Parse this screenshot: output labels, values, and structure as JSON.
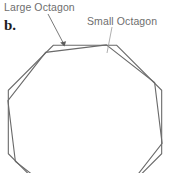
{
  "figure": {
    "part_letter": "b.",
    "labels": {
      "large_octagon": "Large Octagon",
      "small_octagon": "Small Octagon"
    },
    "colors": {
      "outline": "#6a6a6a",
      "label_text": "#6e6e6e",
      "part_letter_text": "#1d1d1d",
      "background": "#ffffff",
      "leader_line": "#7a7a7a"
    }
  },
  "chart_data": {
    "type": "diagram",
    "title": "",
    "shapes": [
      {
        "name": "Large Octagon",
        "sides": 8,
        "center": [
          85,
          122
        ],
        "circumradius": 83,
        "rotation_deg": 22.5,
        "stroke": "#6a6a6a",
        "stroke_width": 1.1,
        "fill": "none"
      },
      {
        "name": "Small Octagon",
        "sides": 8,
        "center": [
          85,
          122
        ],
        "circumradius": 80,
        "rotation_deg": 15.5,
        "stroke": "#6a6a6a",
        "stroke_width": 1.1,
        "fill": "none"
      }
    ],
    "annotations": [
      {
        "text": "Large Octagon",
        "anchor": [
          4,
          1
        ],
        "leader_from": [
          48,
          14
        ],
        "leader_to": [
          64,
          45
        ],
        "arrowhead": true
      },
      {
        "text": "Small Octagon",
        "anchor": [
          87,
          15
        ],
        "leader_from": [
          112,
          27
        ],
        "leader_to": [
          107,
          52
        ],
        "arrowhead": false
      }
    ]
  }
}
